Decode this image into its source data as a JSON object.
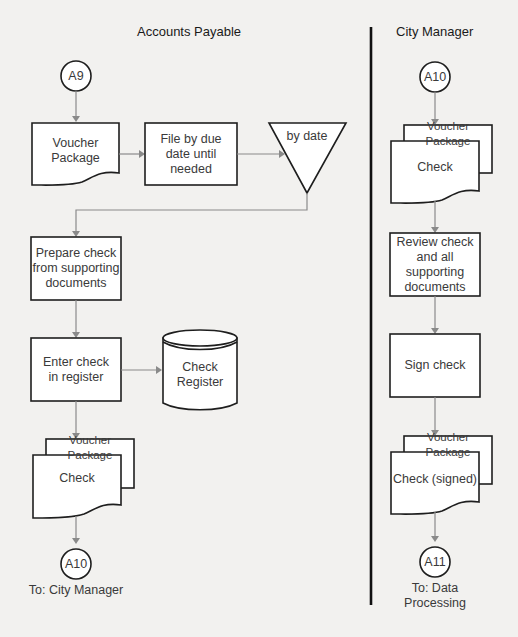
{
  "lanes": {
    "accounts_payable": {
      "title": "Accounts Payable"
    },
    "city_manager": {
      "title": "City Manager"
    }
  },
  "accounts_payable": {
    "connector_in": "A9",
    "voucher_doc": "Voucher\nPackage",
    "file_process": "File by due\ndate until\nneeded",
    "file_storage": "by date",
    "prepare_process": "Prepare check\nfrom supporting\ndocuments",
    "enter_process": "Enter check\nin register",
    "register_db": "Check\nRegister",
    "out_doc_back": "Voucher Package",
    "out_doc_front": "Check",
    "connector_out": "A10",
    "connector_out_label": "To: City Manager"
  },
  "city_manager": {
    "connector_in": "A10",
    "in_doc_back": "Voucher Package",
    "in_doc_front": "Check",
    "review_process": "Review check\nand all\nsupporting\ndocuments",
    "sign_process": "Sign check",
    "out_doc_back": "Voucher Package",
    "out_doc_front": "Check (signed)",
    "connector_out": "A11",
    "connector_out_label": "To: Data\nProcessing"
  },
  "colors": {
    "background": "#f2f1ef",
    "shape_stroke": "#1e1e1e",
    "connector": "#8a8a8a",
    "divider": "#111111"
  }
}
